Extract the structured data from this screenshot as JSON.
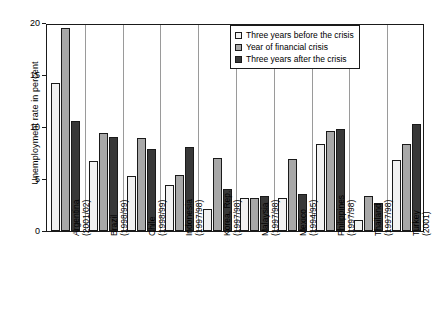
{
  "chart_data": {
    "type": "bar",
    "title": "",
    "xlabel": "",
    "ylabel": "Unemployment rate in percent",
    "ylim": [
      0,
      20
    ],
    "yticks": [
      0,
      5,
      10,
      15,
      20
    ],
    "grid": false,
    "legend_position": "top-right",
    "categories": [
      "Argentina (2001/02)",
      "Brazil (1998/99)",
      "Chile (1998/99)",
      "Indonesia (1997/98)",
      "Korea, Rep. (1997/98)",
      "Malaysia (1997/98)",
      "Mexico (1994/95)",
      "Philippines (1997/98)",
      "Thailand (1997/98)",
      "Turkey (2001)"
    ],
    "category_lines": [
      [
        "Argentina",
        "(2001/02)"
      ],
      [
        "Brazil",
        "(1998/99)"
      ],
      [
        "Chile",
        "(1998/99)"
      ],
      [
        "Indonesia",
        "(1997/98)"
      ],
      [
        "Korea, Rep.",
        "(1997/98)"
      ],
      [
        "Malaysia",
        "(1997/98)"
      ],
      [
        "Mexico",
        "(1994/95)"
      ],
      [
        "Philippines",
        "(1997/98)"
      ],
      [
        "Thailand",
        "(1997/98)"
      ],
      [
        "Turkey",
        "(2001)"
      ]
    ],
    "series": [
      {
        "name": "Three years before the crisis",
        "color": "#f2f2f2",
        "values": [
          14.2,
          6.7,
          5.3,
          4.4,
          2.1,
          3.2,
          3.2,
          8.4,
          1.1,
          6.8
        ]
      },
      {
        "name": "Year of financial crisis",
        "color": "#a8a8a8",
        "values": [
          19.5,
          9.4,
          8.9,
          5.4,
          7.0,
          3.2,
          6.9,
          9.6,
          3.4,
          8.4
        ]
      },
      {
        "name": "Three years after the crisis",
        "color": "#383838",
        "values": [
          10.6,
          9.0,
          7.9,
          8.1,
          4.0,
          3.4,
          3.6,
          9.8,
          2.7,
          10.3
        ]
      }
    ]
  },
  "legend": {
    "items": [
      {
        "label": "Three years before the crisis",
        "color": "#f2f2f2"
      },
      {
        "label": "Year of financial crisis",
        "color": "#a8a8a8"
      },
      {
        "label": "Three years after the crisis",
        "color": "#383838"
      }
    ]
  }
}
